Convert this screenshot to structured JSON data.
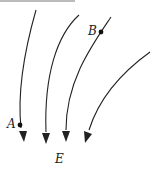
{
  "diagram": {
    "type": "electric-field-lines",
    "field_label": "E",
    "points": [
      {
        "label": "A",
        "x": 20,
        "y": 125
      },
      {
        "label": "B",
        "x": 101,
        "y": 32
      }
    ],
    "lines": [
      {
        "name": "field-line-1",
        "path": "M36,10 C26,45 17,90 21,128"
      },
      {
        "name": "field-line-2",
        "path": "M79,15 C57,35 44,75 46,132"
      },
      {
        "name": "field-line-3",
        "path": "M111,17 C93,44 66,80 66,130"
      },
      {
        "name": "field-line-4",
        "path": "M150,52 C125,70 100,95 89,130"
      }
    ],
    "arrows": [
      {
        "name": "arrow-1",
        "points": "19,131 27,131 24,142"
      },
      {
        "name": "arrow-2",
        "points": "42,133 50,133 46,144"
      },
      {
        "name": "arrow-3",
        "points": "62,131 70,131 66,142"
      },
      {
        "name": "arrow-4",
        "points": "84,131 92,134 85,143"
      }
    ],
    "colors": {
      "ink": "#222222",
      "background": "#ffffff"
    }
  }
}
